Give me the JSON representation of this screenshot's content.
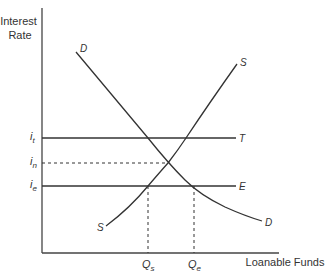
{
  "diagram": {
    "y_axis_label_line1": "Interest",
    "y_axis_label_line2": "Rate",
    "x_axis_label": "Loanable Funds",
    "curves": {
      "demand_top_label": "D",
      "demand_bottom_label": "D",
      "supply_top_label": "S",
      "supply_bottom_label": "S"
    },
    "horizontal_lines": {
      "t_label": "T",
      "e_label": "E"
    },
    "y_ticks": {
      "it_main": "i",
      "it_sub": "t",
      "in_main": "i",
      "in_sub": "n",
      "ie_main": "i",
      "ie_sub": "e"
    },
    "x_ticks": {
      "qs_main": "Q",
      "qs_sub": "s",
      "qe_main": "Q",
      "qe_sub": "e"
    },
    "colors": {
      "line": "#333333",
      "background": "#ffffff"
    }
  }
}
